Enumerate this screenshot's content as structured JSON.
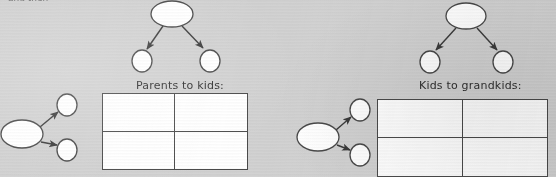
{
  "page": {
    "width": 556,
    "height": 177,
    "background_color": "#d2d2d2",
    "cropped_top_heading": "and then"
  },
  "labels": {
    "parents_to_kids": "Parents to kids:",
    "kids_to_grandkids": "Kids to grandkids:"
  },
  "colors": {
    "paper": "#d2d2d2",
    "ink": "#3a3a3a",
    "node_fill": "#ffffff",
    "node_stroke": "#4a4a4a",
    "table_border": "#4a4a4a",
    "table_fill": "#ffffff",
    "text": "#2f2f2f"
  },
  "diagrams": [
    {
      "id": "top-left-tree",
      "name": "parent-to-two-children-tree",
      "orientation": "top-down",
      "nodes": [
        {
          "id": "tl-parent",
          "shape": "ellipse",
          "cx": 172,
          "cy": 14,
          "rx": 21,
          "ry": 13,
          "label": ""
        },
        {
          "id": "tl-child-left",
          "shape": "circle",
          "cx": 142,
          "cy": 61,
          "rx": 10,
          "ry": 11,
          "label": ""
        },
        {
          "id": "tl-child-right",
          "shape": "circle",
          "cx": 210,
          "cy": 61,
          "rx": 10,
          "ry": 11,
          "label": ""
        }
      ],
      "edges": [
        {
          "from": "tl-parent",
          "to": "tl-child-left",
          "arrow": true
        },
        {
          "from": "tl-parent",
          "to": "tl-child-right",
          "arrow": true
        }
      ]
    },
    {
      "id": "top-right-tree",
      "name": "parent-to-two-children-tree",
      "orientation": "top-down",
      "nodes": [
        {
          "id": "tr-parent",
          "shape": "ellipse",
          "cx": 466,
          "cy": 16,
          "rx": 20,
          "ry": 13,
          "label": ""
        },
        {
          "id": "tr-child-left",
          "shape": "circle",
          "cx": 430,
          "cy": 62,
          "rx": 10,
          "ry": 11,
          "label": ""
        },
        {
          "id": "tr-child-right",
          "shape": "circle",
          "cx": 503,
          "cy": 62,
          "rx": 10,
          "ry": 11,
          "label": ""
        }
      ],
      "edges": [
        {
          "from": "tr-parent",
          "to": "tr-child-left",
          "arrow": true
        },
        {
          "from": "tr-parent",
          "to": "tr-child-right",
          "arrow": true
        }
      ]
    },
    {
      "id": "bottom-left-tree",
      "name": "node-to-two-nodes-tree",
      "orientation": "left-right",
      "nodes": [
        {
          "id": "bl-parent",
          "shape": "ellipse",
          "cx": 22,
          "cy": 134,
          "rx": 21,
          "ry": 14,
          "label": ""
        },
        {
          "id": "bl-child-top",
          "shape": "circle",
          "cx": 67,
          "cy": 105,
          "rx": 10,
          "ry": 11,
          "label": ""
        },
        {
          "id": "bl-child-bottom",
          "shape": "circle",
          "cx": 67,
          "cy": 150,
          "rx": 10,
          "ry": 11,
          "label": ""
        }
      ],
      "edges": [
        {
          "from": "bl-parent",
          "to": "bl-child-top",
          "arrow": true
        },
        {
          "from": "bl-parent",
          "to": "bl-child-bottom",
          "arrow": true
        }
      ]
    },
    {
      "id": "bottom-right-tree",
      "name": "node-to-two-nodes-tree",
      "orientation": "left-right",
      "nodes": [
        {
          "id": "br-parent",
          "shape": "ellipse",
          "cx": 318,
          "cy": 137,
          "rx": 21,
          "ry": 14,
          "label": ""
        },
        {
          "id": "br-child-top",
          "shape": "circle",
          "cx": 360,
          "cy": 110,
          "rx": 10,
          "ry": 11,
          "label": ""
        },
        {
          "id": "br-child-bottom",
          "shape": "circle",
          "cx": 360,
          "cy": 155,
          "rx": 10,
          "ry": 11,
          "label": ""
        }
      ],
      "edges": [
        {
          "from": "br-parent",
          "to": "br-child-top",
          "arrow": true
        },
        {
          "from": "br-parent",
          "to": "br-child-bottom",
          "arrow": true
        }
      ]
    }
  ],
  "tables": [
    {
      "id": "table-parents-kids",
      "name": "parents-to-kids-table",
      "caption": "Parents to kids:",
      "rows": 2,
      "columns": 2,
      "cells": [
        [
          "",
          ""
        ],
        [
          "",
          ""
        ]
      ]
    },
    {
      "id": "table-kids-grandkids",
      "name": "kids-to-grandkids-table",
      "caption": "Kids to grandkids:",
      "rows": 2,
      "columns": 2,
      "cells": [
        [
          "",
          ""
        ],
        [
          "",
          ""
        ]
      ]
    }
  ]
}
